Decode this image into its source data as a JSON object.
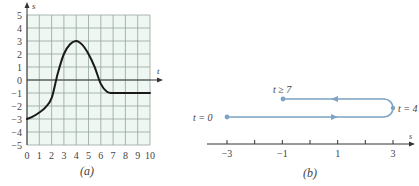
{
  "chart_data": [
    {
      "id": "a",
      "type": "line",
      "caption": "(a)",
      "title": "",
      "xlabel": "t",
      "ylabel": "s",
      "xlim": [
        0,
        10
      ],
      "ylim": [
        -5,
        5
      ],
      "grid": true,
      "x_ticks": [
        0,
        1,
        2,
        3,
        4,
        5,
        6,
        7,
        8,
        9,
        10
      ],
      "y_ticks": [
        5,
        4,
        3,
        2,
        1,
        0,
        -1,
        -2,
        -3,
        -4,
        -5
      ],
      "series": [
        {
          "name": "s(t)",
          "x": [
            0,
            0.5,
            1,
            1.5,
            2,
            2.5,
            3,
            3.5,
            4,
            4.5,
            5,
            5.5,
            6,
            6.5,
            7,
            8,
            9,
            10
          ],
          "y": [
            -3,
            -2.8,
            -2.5,
            -2.1,
            -1.4,
            0.5,
            2.0,
            2.75,
            3,
            2.7,
            2.0,
            1.0,
            -0.3,
            -0.9,
            -1,
            -1,
            -1,
            -1
          ]
        }
      ],
      "colors": {
        "grid_bg": "#eef7f2",
        "grid_line": "#94a59d",
        "curve": "#1a1a1a",
        "axis": "#333333"
      }
    },
    {
      "id": "b",
      "type": "line",
      "caption": "(b)",
      "title": "",
      "xlabel": "s",
      "ylabel": "",
      "xlim": [
        -3.5,
        3.7
      ],
      "x_ticks": [
        -3,
        -2,
        -1,
        0,
        1,
        2,
        3
      ],
      "x_tick_labels": [
        "-3",
        "",
        "-1",
        "",
        "1",
        "",
        "3"
      ],
      "grid": false,
      "annotations": [
        {
          "label": "t = 0",
          "s": -3,
          "position": "start of path"
        },
        {
          "label": "t = 4",
          "s": 3,
          "position": "turnaround point"
        },
        {
          "label": "t ≥ 7",
          "s": -1,
          "position": "end of path"
        }
      ],
      "path_description": "Particle moves right from s=-3 at t=0 to s=3 at t=4, then moves left to s=-1 where it remains for t≥7",
      "colors": {
        "path": "#7ea3c4",
        "axis": "#333333"
      }
    }
  ],
  "labels": {
    "a_caption": "(a)",
    "b_caption": "(b)",
    "a_xlabel": "t",
    "a_ylabel": "s",
    "b_xlabel": "s",
    "b_t0": "t = 0",
    "b_t4": "t = 4",
    "b_t7": "t ≥ 7",
    "a_xticks": [
      "0",
      "1",
      "2",
      "3",
      "4",
      "5",
      "6",
      "7",
      "8",
      "9",
      "10"
    ],
    "a_yticks": [
      "5",
      "4",
      "3",
      "2",
      "1",
      "0",
      "-1",
      "-2",
      "-3",
      "-4",
      "-5"
    ],
    "b_xticks": [
      "-3",
      "-1",
      "1",
      "3"
    ]
  }
}
